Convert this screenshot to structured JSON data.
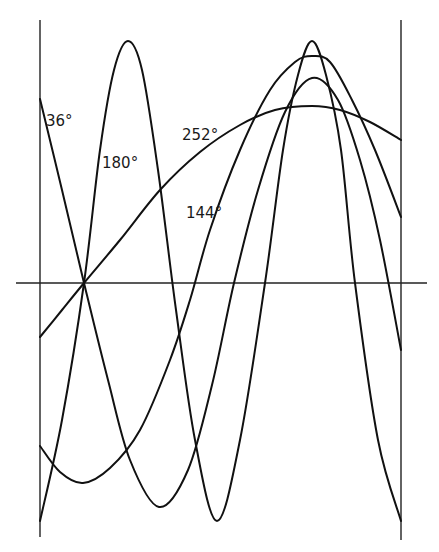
{
  "figure": {
    "labels": [
      {
        "text": "36°",
        "x": 46,
        "y": 126
      },
      {
        "text": "180°",
        "x": 102,
        "y": 168
      },
      {
        "text": "252°",
        "x": 182,
        "y": 140
      },
      {
        "text": "144°",
        "x": 186,
        "y": 218
      }
    ],
    "axes": {
      "left_vertical": {
        "x": 40,
        "y1": 20,
        "y2": 537
      },
      "right_vertical": {
        "x": 401,
        "y1": 20,
        "y2": 540
      },
      "horizontal": {
        "y": 283,
        "x1": 16,
        "x2": 427
      }
    },
    "curves": [
      {
        "label": "36°",
        "points": [
          [
            40,
            99
          ],
          [
            62,
            190
          ],
          [
            84,
            283
          ],
          [
            108,
            380
          ],
          [
            130,
            460
          ],
          [
            159,
            507
          ],
          [
            188,
            470
          ],
          [
            212,
            385
          ],
          [
            234,
            283
          ],
          [
            258,
            190
          ],
          [
            285,
            112
          ],
          [
            312,
            78
          ],
          [
            338,
            100
          ],
          [
            360,
            160
          ],
          [
            380,
            240
          ],
          [
            401,
            350
          ]
        ]
      },
      {
        "label": "180°",
        "points": [
          [
            40,
            521
          ],
          [
            62,
            420
          ],
          [
            84,
            283
          ],
          [
            100,
            150
          ],
          [
            114,
            70
          ],
          [
            128,
            41
          ],
          [
            142,
            70
          ],
          [
            158,
            170
          ],
          [
            176,
            310
          ],
          [
            195,
            440
          ],
          [
            217,
            521
          ],
          [
            240,
            440
          ],
          [
            265,
            283
          ],
          [
            283,
            150
          ],
          [
            298,
            75
          ],
          [
            312,
            41
          ],
          [
            326,
            75
          ],
          [
            341,
            150
          ],
          [
            355,
            283
          ],
          [
            378,
            440
          ],
          [
            401,
            521
          ]
        ]
      },
      {
        "label": "144°",
        "points": [
          [
            40,
            446
          ],
          [
            60,
            472
          ],
          [
            83,
            483
          ],
          [
            110,
            468
          ],
          [
            140,
            430
          ],
          [
            170,
            360
          ],
          [
            190,
            300
          ],
          [
            210,
            230
          ],
          [
            240,
            150
          ],
          [
            270,
            90
          ],
          [
            295,
            62
          ],
          [
            312,
            56
          ],
          [
            330,
            62
          ],
          [
            352,
            100
          ],
          [
            375,
            150
          ],
          [
            401,
            217
          ]
        ]
      },
      {
        "label": "252°",
        "points": [
          [
            40,
            337
          ],
          [
            62,
            310
          ],
          [
            84,
            283
          ],
          [
            120,
            240
          ],
          [
            160,
            190
          ],
          [
            200,
            152
          ],
          [
            240,
            125
          ],
          [
            275,
            110
          ],
          [
            312,
            106
          ],
          [
            340,
            110
          ],
          [
            370,
            122
          ],
          [
            401,
            140
          ]
        ]
      }
    ]
  },
  "chart_data": {
    "type": "line",
    "title": "",
    "xlabel": "",
    "ylabel": "",
    "series": [
      {
        "name": "36°"
      },
      {
        "name": "180°"
      },
      {
        "name": "144°"
      },
      {
        "name": "252°"
      }
    ],
    "grid": false,
    "legend": "inline labels"
  }
}
